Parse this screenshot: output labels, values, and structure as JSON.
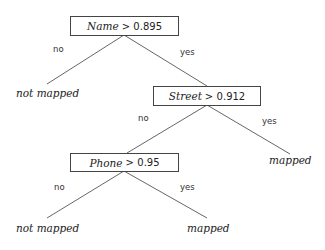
{
  "tree": {
    "root": {
      "feature": "Name",
      "op": ">",
      "threshold": "0.895"
    },
    "node2": {
      "feature": "Street",
      "op": ">",
      "threshold": "0.912"
    },
    "node3": {
      "feature": "Phone",
      "op": ">",
      "threshold": "0.95"
    },
    "edges": {
      "no": "no",
      "yes": "yes"
    },
    "leaves": {
      "root_no": "not mapped",
      "node2_yes": "mapped",
      "node3_no": "not mapped",
      "node3_yes": "mapped"
    }
  }
}
